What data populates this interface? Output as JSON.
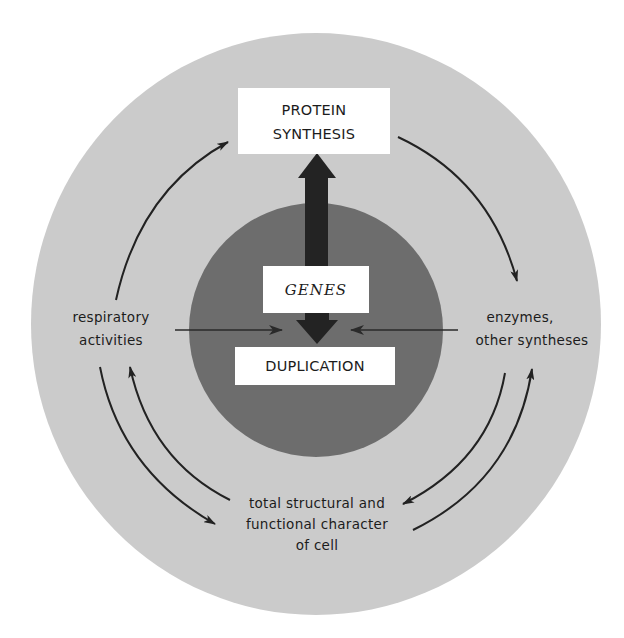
{
  "diagram": {
    "type": "cell regulation cycle",
    "colors": {
      "background": "#ffffff",
      "outer_disc": "#cbcbcb",
      "inner_disc": "#6d6d6d",
      "box_fill": "#ffffff",
      "arrow": "#222222",
      "big_arrow": "#232323"
    },
    "nodes": {
      "protein_synthesis": {
        "line1": "PROTEIN",
        "line2": "SYNTHESIS"
      },
      "genes": {
        "label": "GENES"
      },
      "duplication": {
        "label": "DUPLICATION"
      },
      "respiratory": {
        "line1": "respiratory",
        "line2": "activities"
      },
      "enzymes": {
        "line1": "enzymes,",
        "line2": "other syntheses"
      },
      "cell_character": {
        "line1": "total structural and",
        "line2": "functional character",
        "line3": "of cell"
      }
    },
    "edges": [
      {
        "from": "GENES",
        "to": "PROTEIN SYNTHESIS",
        "style": "thick"
      },
      {
        "from": "GENES",
        "to": "DUPLICATION",
        "style": "thick"
      },
      {
        "from": "PROTEIN SYNTHESIS",
        "to": "enzymes, other syntheses"
      },
      {
        "from": "respiratory activities",
        "to": "PROTEIN SYNTHESIS"
      },
      {
        "from": "respiratory activities",
        "to": "DUPLICATION"
      },
      {
        "from": "enzymes, other syntheses",
        "to": "DUPLICATION"
      },
      {
        "from": "respiratory activities",
        "to": "total structural and functional character of cell"
      },
      {
        "from": "total structural and functional character of cell",
        "to": "respiratory activities"
      },
      {
        "from": "enzymes, other syntheses",
        "to": "total structural and functional character of cell"
      },
      {
        "from": "total structural and functional character of cell",
        "to": "enzymes, other syntheses"
      }
    ]
  }
}
